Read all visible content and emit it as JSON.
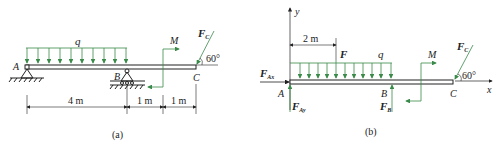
{
  "colors": {
    "line": "#222222",
    "load": "#3a8a4a",
    "dim": "#222222"
  },
  "figure_a": {
    "caption": "(a)",
    "labels": {
      "q": "q",
      "M": "M",
      "Fc": "F",
      "Fc_sub": "C",
      "angle": "60°",
      "A": "A",
      "B": "B",
      "C": "C"
    },
    "dimensions": [
      "4 m",
      "1 m",
      "1 m"
    ]
  },
  "figure_b": {
    "caption": "(b)",
    "labels": {
      "y": "y",
      "x": "x",
      "dim": "2 m",
      "F": "F",
      "q": "q",
      "M": "M",
      "Fc": "F",
      "Fc_sub": "C",
      "angle": "60°",
      "FAx": "F",
      "FAx_sub": "Ax",
      "FAy": "F",
      "FAy_sub": "Ay",
      "FB": "F",
      "FB_sub": "B",
      "A": "A",
      "B": "B",
      "C": "C"
    }
  }
}
